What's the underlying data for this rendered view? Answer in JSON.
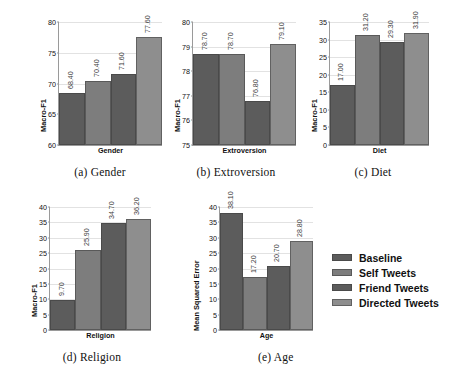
{
  "figure": {
    "series_names": [
      "Baseline",
      "Self Tweets",
      "Friend Tweets",
      "Directed Tweets"
    ],
    "series_colors": [
      "#5c5c5c",
      "#7d7d7d",
      "#5c5c5c",
      "#8e8e8e"
    ]
  },
  "legend": {
    "position": "right-middle",
    "items": [
      {
        "label": "Baseline",
        "color": "#5c5c5c"
      },
      {
        "label": "Self Tweets",
        "color": "#7d7d7d"
      },
      {
        "label": "Friend Tweets",
        "color": "#5c5c5c"
      },
      {
        "label": "Directed Tweets",
        "color": "#8e8e8e"
      }
    ]
  },
  "chart_data": [
    {
      "id": "gender",
      "type": "bar",
      "title": "(a) Gender",
      "xlabel": "Gender",
      "ylabel": "Macro-F1",
      "categories": [
        "Baseline",
        "Self Tweets",
        "Friend Tweets",
        "Directed Tweets"
      ],
      "values": [
        68.4,
        70.4,
        71.6,
        77.6
      ],
      "value_labels": [
        "68.40",
        "70.40",
        "71.60",
        "77.60"
      ],
      "ylim": [
        60,
        80
      ],
      "yticks": [
        60,
        65,
        70,
        75,
        80
      ],
      "ytick_labels": [
        "60",
        "65",
        "70",
        "75",
        "80"
      ],
      "grid": true
    },
    {
      "id": "extroversion",
      "type": "bar",
      "title": "(b) Extroversion",
      "xlabel": "Extroversion",
      "ylabel": "Macro-F1",
      "categories": [
        "Baseline",
        "Self Tweets",
        "Friend Tweets",
        "Directed Tweets"
      ],
      "values": [
        78.7,
        78.7,
        76.8,
        79.1
      ],
      "value_labels": [
        "78.70",
        "78.70",
        "76.80",
        "79.10"
      ],
      "ylim": [
        75,
        80
      ],
      "yticks": [
        75,
        76,
        77,
        78,
        79,
        80
      ],
      "ytick_labels": [
        "75",
        "76",
        "77",
        "78",
        "79",
        "80"
      ],
      "grid": true
    },
    {
      "id": "diet",
      "type": "bar",
      "title": "(c) Diet",
      "xlabel": "Diet",
      "ylabel": "Macro-F1",
      "categories": [
        "Baseline",
        "Self Tweets",
        "Friend Tweets",
        "Directed Tweets"
      ],
      "values": [
        17.0,
        31.2,
        29.3,
        31.9
      ],
      "value_labels": [
        "17.00",
        "31.20",
        "29.30",
        "31.90"
      ],
      "ylim": [
        0,
        35
      ],
      "yticks": [
        0,
        5,
        10,
        15,
        20,
        25,
        30,
        35
      ],
      "ytick_labels": [
        "0",
        "5",
        "10",
        "15",
        "20",
        "25",
        "30",
        "35"
      ],
      "grid": true
    },
    {
      "id": "religion",
      "type": "bar",
      "title": "(d) Religion",
      "xlabel": "Religion",
      "ylabel": "Macro-F1",
      "categories": [
        "Baseline",
        "Self Tweets",
        "Friend Tweets",
        "Directed Tweets"
      ],
      "values": [
        9.7,
        25.9,
        34.7,
        36.2
      ],
      "value_labels": [
        "9.70",
        "25.90",
        "34.70",
        "36.20"
      ],
      "ylim": [
        0,
        40
      ],
      "yticks": [
        0,
        5,
        10,
        15,
        20,
        25,
        30,
        35,
        40
      ],
      "ytick_labels": [
        "0",
        "5",
        "10",
        "15",
        "20",
        "25",
        "30",
        "35",
        "40"
      ],
      "grid": true
    },
    {
      "id": "age",
      "type": "bar",
      "title": "(e) Age",
      "xlabel": "Age",
      "ylabel": "Mean Squared Error",
      "categories": [
        "Baseline",
        "Self Tweets",
        "Friend Tweets",
        "Directed Tweets"
      ],
      "values": [
        38.1,
        17.2,
        20.7,
        28.8
      ],
      "value_labels": [
        "38.10",
        "17.20",
        "20.70",
        "28.80"
      ],
      "ylim": [
        0,
        40
      ],
      "yticks": [
        0,
        5,
        10,
        15,
        20,
        25,
        30,
        35,
        40
      ],
      "ytick_labels": [
        "0",
        "5",
        "10",
        "15",
        "20",
        "25",
        "30",
        "35",
        "40"
      ],
      "grid": true
    }
  ]
}
